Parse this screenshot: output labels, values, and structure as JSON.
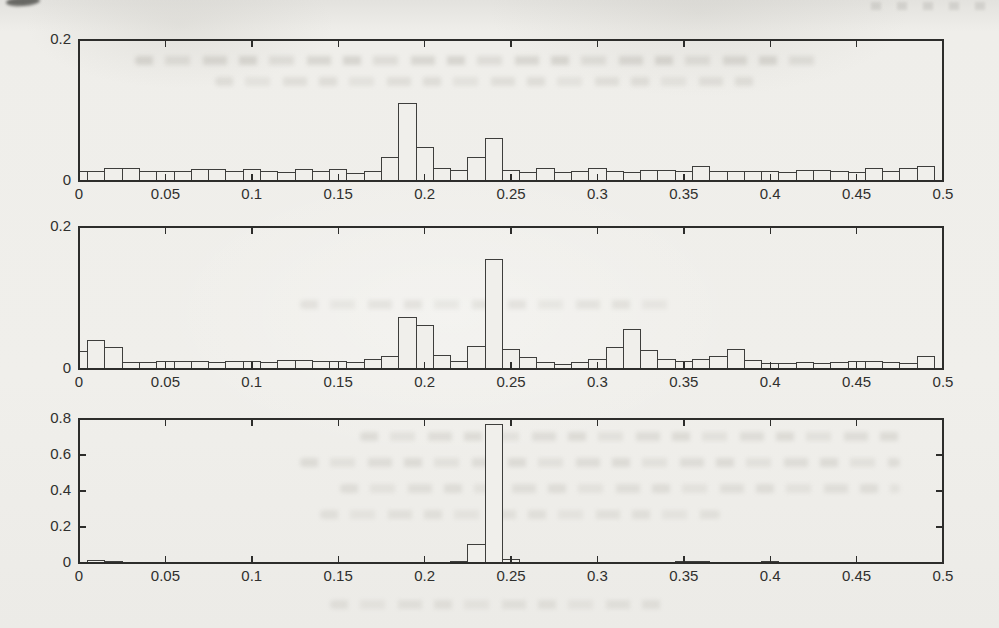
{
  "figure": {
    "kind": "scanned paper figure",
    "panel_count": 3
  },
  "chart_data": [
    {
      "type": "histogram",
      "title": "",
      "xlabel": "",
      "ylabel": "",
      "xlim": [
        0,
        0.5
      ],
      "ylim": [
        0,
        0.2
      ],
      "x_tick_values": [
        0,
        0.05,
        0.1,
        0.15,
        0.2,
        0.25,
        0.3,
        0.35,
        0.4,
        0.45,
        0.5
      ],
      "x_tick_labels": [
        "0",
        "0.05",
        "0.1",
        "0.15",
        "0.2",
        "0.25",
        "0.3",
        "0.35",
        "0.4",
        "0.45",
        "0.5"
      ],
      "y_tick_values": [
        0,
        0.2
      ],
      "y_tick_labels": [
        "0",
        "0.2"
      ],
      "grid": false,
      "legend": null,
      "bin_width": 0.01,
      "bin_centers": [
        0,
        0.01,
        0.02,
        0.03,
        0.04,
        0.05,
        0.06,
        0.07,
        0.08,
        0.09,
        0.1,
        0.11,
        0.12,
        0.13,
        0.14,
        0.15,
        0.16,
        0.17,
        0.18,
        0.19,
        0.2,
        0.21,
        0.22,
        0.23,
        0.24,
        0.25,
        0.26,
        0.27,
        0.28,
        0.29,
        0.3,
        0.31,
        0.32,
        0.33,
        0.34,
        0.35,
        0.36,
        0.37,
        0.38,
        0.39,
        0.4,
        0.41,
        0.42,
        0.43,
        0.44,
        0.45,
        0.46,
        0.47,
        0.48,
        0.49
      ],
      "values": [
        0.013,
        0.013,
        0.018,
        0.018,
        0.013,
        0.013,
        0.013,
        0.016,
        0.016,
        0.013,
        0.016,
        0.013,
        0.012,
        0.016,
        0.014,
        0.016,
        0.01,
        0.013,
        0.033,
        0.11,
        0.048,
        0.018,
        0.015,
        0.034,
        0.06,
        0.015,
        0.012,
        0.018,
        0.012,
        0.014,
        0.018,
        0.013,
        0.012,
        0.015,
        0.015,
        0.014,
        0.02,
        0.014,
        0.013,
        0.014,
        0.014,
        0.012,
        0.015,
        0.015,
        0.013,
        0.012,
        0.018,
        0.013,
        0.018,
        0.02
      ]
    },
    {
      "type": "histogram",
      "title": "",
      "xlabel": "",
      "ylabel": "",
      "xlim": [
        0,
        0.5
      ],
      "ylim": [
        0,
        0.2
      ],
      "x_tick_values": [
        0,
        0.05,
        0.1,
        0.15,
        0.2,
        0.25,
        0.3,
        0.35,
        0.4,
        0.45,
        0.5
      ],
      "x_tick_labels": [
        "0",
        "0.05",
        "0.1",
        "0.15",
        "0.2",
        "0.25",
        "0.3",
        "0.35",
        "0.4",
        "0.45",
        "0.5"
      ],
      "y_tick_values": [
        0,
        0.2
      ],
      "y_tick_labels": [
        "0",
        "0.2"
      ],
      "grid": false,
      "legend": null,
      "bin_width": 0.01,
      "bin_centers": [
        0,
        0.01,
        0.02,
        0.03,
        0.04,
        0.05,
        0.06,
        0.07,
        0.08,
        0.09,
        0.1,
        0.11,
        0.12,
        0.13,
        0.14,
        0.15,
        0.16,
        0.17,
        0.18,
        0.19,
        0.2,
        0.21,
        0.22,
        0.23,
        0.24,
        0.25,
        0.26,
        0.27,
        0.28,
        0.29,
        0.3,
        0.31,
        0.32,
        0.33,
        0.34,
        0.35,
        0.36,
        0.37,
        0.38,
        0.39,
        0.4,
        0.41,
        0.42,
        0.43,
        0.44,
        0.45,
        0.46,
        0.47,
        0.48,
        0.49
      ],
      "values": [
        0.025,
        0.04,
        0.03,
        0.009,
        0.009,
        0.01,
        0.01,
        0.011,
        0.009,
        0.011,
        0.011,
        0.009,
        0.012,
        0.012,
        0.01,
        0.011,
        0.009,
        0.013,
        0.018,
        0.073,
        0.061,
        0.019,
        0.01,
        0.032,
        0.155,
        0.027,
        0.016,
        0.009,
        0.007,
        0.009,
        0.013,
        0.03,
        0.055,
        0.026,
        0.013,
        0.011,
        0.014,
        0.018,
        0.028,
        0.012,
        0.008,
        0.008,
        0.009,
        0.008,
        0.009,
        0.01,
        0.011,
        0.009,
        0.008,
        0.018
      ]
    },
    {
      "type": "histogram",
      "title": "",
      "xlabel": "",
      "ylabel": "",
      "xlim": [
        0,
        0.5
      ],
      "ylim": [
        0,
        0.8
      ],
      "x_tick_values": [
        0,
        0.05,
        0.1,
        0.15,
        0.2,
        0.25,
        0.3,
        0.35,
        0.4,
        0.45,
        0.5
      ],
      "x_tick_labels": [
        "0",
        "0.05",
        "0.1",
        "0.15",
        "0.2",
        "0.25",
        "0.3",
        "0.35",
        "0.4",
        "0.45",
        "0.5"
      ],
      "y_tick_values": [
        0,
        0.2,
        0.4,
        0.6,
        0.8
      ],
      "y_tick_labels": [
        "0",
        "0.2",
        "0.4",
        "0.6",
        "0.8"
      ],
      "grid": false,
      "legend": null,
      "bin_width": 0.01,
      "bin_centers": [
        0,
        0.01,
        0.02,
        0.03,
        0.04,
        0.05,
        0.06,
        0.07,
        0.08,
        0.09,
        0.1,
        0.11,
        0.12,
        0.13,
        0.14,
        0.15,
        0.16,
        0.17,
        0.18,
        0.19,
        0.2,
        0.21,
        0.22,
        0.23,
        0.24,
        0.25,
        0.26,
        0.27,
        0.28,
        0.29,
        0.3,
        0.31,
        0.32,
        0.33,
        0.34,
        0.35,
        0.36,
        0.37,
        0.38,
        0.39,
        0.4,
        0.41,
        0.42,
        0.43,
        0.44,
        0.45,
        0.46,
        0.47,
        0.48,
        0.49
      ],
      "values": [
        0,
        0.012,
        0.01,
        0,
        0,
        0,
        0,
        0,
        0,
        0,
        0,
        0,
        0,
        0,
        0,
        0,
        0,
        0,
        0,
        0,
        0,
        0,
        0.01,
        0.105,
        0.77,
        0.022,
        0,
        0,
        0,
        0,
        0,
        0,
        0,
        0,
        0,
        0.008,
        0.008,
        0,
        0,
        0,
        0.008,
        0,
        0,
        0,
        0,
        0,
        0,
        0,
        0,
        0
      ]
    }
  ]
}
